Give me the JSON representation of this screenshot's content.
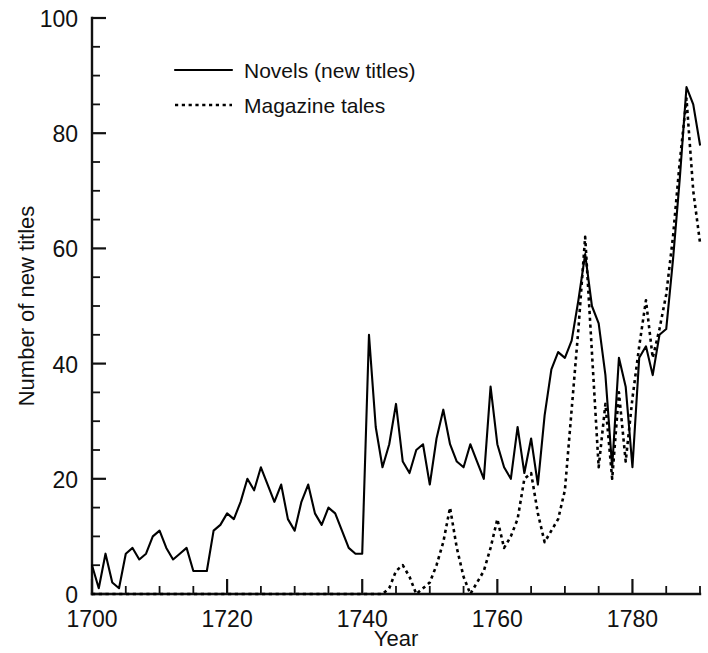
{
  "chart_data": {
    "type": "line",
    "title": "",
    "xlabel": "Year",
    "ylabel": "Number of new titles",
    "xlim": [
      1700,
      1790
    ],
    "ylim": [
      0,
      100
    ],
    "grid": false,
    "legend_position": "top-center-left",
    "x_ticks_major": [
      1700,
      1720,
      1740,
      1760,
      1780
    ],
    "x_tick_labels": [
      "1700",
      "1720",
      "1740",
      "1760",
      "1780"
    ],
    "x_tick_minor_step": 5,
    "y_ticks_major": [
      0,
      20,
      40,
      60,
      80,
      100
    ],
    "y_tick_labels": [
      "0",
      "20",
      "40",
      "60",
      "80",
      "100"
    ],
    "y_tick_minor_step": 5,
    "x": [
      1700,
      1701,
      1702,
      1703,
      1704,
      1705,
      1706,
      1707,
      1708,
      1709,
      1710,
      1711,
      1712,
      1713,
      1714,
      1715,
      1716,
      1717,
      1718,
      1719,
      1720,
      1721,
      1722,
      1723,
      1724,
      1725,
      1726,
      1727,
      1728,
      1729,
      1730,
      1731,
      1732,
      1733,
      1734,
      1735,
      1736,
      1737,
      1738,
      1739,
      1740,
      1741,
      1742,
      1743,
      1744,
      1745,
      1746,
      1747,
      1748,
      1749,
      1750,
      1751,
      1752,
      1753,
      1754,
      1755,
      1756,
      1757,
      1758,
      1759,
      1760,
      1761,
      1762,
      1763,
      1764,
      1765,
      1766,
      1767,
      1768,
      1769,
      1770,
      1771,
      1772,
      1773,
      1774,
      1775,
      1776,
      1777,
      1778,
      1779,
      1780,
      1781,
      1782,
      1783,
      1784,
      1785,
      1786,
      1787,
      1788,
      1789,
      1790
    ],
    "series": [
      {
        "name": "Novels (new titles)",
        "style": "solid",
        "values": [
          5,
          1,
          7,
          2,
          1,
          7,
          8,
          6,
          7,
          10,
          11,
          8,
          6,
          7,
          8,
          4,
          4,
          4,
          11,
          12,
          14,
          13,
          16,
          20,
          18,
          22,
          19,
          16,
          19,
          13,
          11,
          16,
          19,
          14,
          12,
          15,
          14,
          11,
          8,
          7,
          7,
          45,
          29,
          22,
          26,
          33,
          23,
          21,
          25,
          26,
          19,
          27,
          32,
          26,
          23,
          22,
          26,
          23,
          20,
          36,
          26,
          22,
          20,
          29,
          21,
          27,
          19,
          31,
          39,
          42,
          41,
          44,
          51,
          59,
          50,
          47,
          38,
          22,
          41,
          36,
          22,
          41,
          43,
          38,
          45,
          46,
          58,
          72,
          88,
          85,
          78
        ]
      },
      {
        "name": "Magazine tales",
        "style": "dotted",
        "values": [
          0,
          0,
          0,
          0,
          0,
          0,
          0,
          0,
          0,
          0,
          0,
          0,
          0,
          0,
          0,
          0,
          0,
          0,
          0,
          0,
          0,
          0,
          0,
          0,
          0,
          0,
          0,
          0,
          0,
          0,
          0,
          0,
          0,
          0,
          0,
          0,
          0,
          0,
          0,
          0,
          0,
          0,
          0,
          0,
          1,
          4,
          5,
          3,
          0,
          1,
          2,
          5,
          9,
          15,
          8,
          3,
          0,
          2,
          4,
          8,
          13,
          8,
          10,
          13,
          20,
          21,
          14,
          9,
          11,
          13,
          18,
          32,
          46,
          62,
          42,
          22,
          33,
          20,
          35,
          23,
          34,
          43,
          51,
          41,
          46,
          52,
          62,
          75,
          86,
          70,
          61
        ]
      }
    ]
  },
  "legend": {
    "entries": [
      {
        "label": "Novels (new titles)",
        "style": "solid"
      },
      {
        "label": "Magazine tales",
        "style": "dotted"
      }
    ]
  },
  "axes": {
    "x_title": "Year",
    "y_title": "Number of new titles"
  }
}
